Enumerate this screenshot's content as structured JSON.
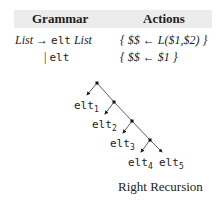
{
  "table": {
    "headers": [
      "Grammar",
      "Actions"
    ],
    "rows": [
      {
        "lhs": "List",
        "arrow": "→",
        "rhs_term": "elt",
        "rhs_nonterm": "List",
        "action": "{ $$ ← L($1,$2) }"
      },
      {
        "bar": "|",
        "rhs_term": "elt",
        "action": "{ $$ ← $1 }"
      }
    ]
  },
  "tree": {
    "leaves": [
      {
        "name": "elt",
        "sub": "1"
      },
      {
        "name": "elt",
        "sub": "2"
      },
      {
        "name": "elt",
        "sub": "3"
      },
      {
        "name": "elt",
        "sub": "4"
      },
      {
        "name": "elt",
        "sub": "5"
      }
    ],
    "caption": "Right Recursion"
  }
}
